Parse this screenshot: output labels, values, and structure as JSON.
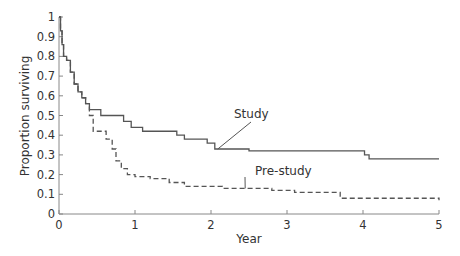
{
  "chart_data": {
    "type": "line",
    "subtype": "step (Kaplan-Meier survival curves)",
    "title": "",
    "xlabel": "Year",
    "ylabel": "Proportion surviving",
    "xlim": [
      0,
      5
    ],
    "ylim": [
      0,
      1
    ],
    "xticks": [
      0,
      1,
      2,
      3,
      4,
      5
    ],
    "yticks": [
      0,
      0.1,
      0.2,
      0.3,
      0.4,
      0.5,
      0.6,
      0.7,
      0.8,
      0.9,
      1
    ],
    "grid": false,
    "legend": "none (direct line annotations)",
    "series": [
      {
        "name": "Study",
        "style": "solid",
        "color": "#555555",
        "x": [
          0,
          0.02,
          0.04,
          0.06,
          0.1,
          0.15,
          0.2,
          0.25,
          0.3,
          0.35,
          0.4,
          0.55,
          0.85,
          0.95,
          1.1,
          1.55,
          1.65,
          1.95,
          2.05,
          2.5,
          4.02,
          4.08,
          5
        ],
        "y": [
          1.0,
          0.93,
          0.86,
          0.8,
          0.78,
          0.72,
          0.66,
          0.62,
          0.59,
          0.56,
          0.53,
          0.5,
          0.47,
          0.44,
          0.42,
          0.4,
          0.38,
          0.36,
          0.33,
          0.32,
          0.3,
          0.28,
          0.28
        ]
      },
      {
        "name": "Pre-study",
        "style": "dashed",
        "color": "#555555",
        "x": [
          0,
          0.02,
          0.04,
          0.06,
          0.1,
          0.15,
          0.2,
          0.25,
          0.3,
          0.35,
          0.4,
          0.45,
          0.62,
          0.7,
          0.75,
          0.82,
          0.9,
          1.0,
          1.2,
          1.45,
          1.65,
          2.15,
          2.8,
          3.1,
          3.7,
          5
        ],
        "y": [
          1.0,
          0.93,
          0.86,
          0.8,
          0.78,
          0.72,
          0.66,
          0.62,
          0.59,
          0.56,
          0.5,
          0.42,
          0.38,
          0.33,
          0.27,
          0.23,
          0.2,
          0.19,
          0.18,
          0.16,
          0.14,
          0.13,
          0.12,
          0.11,
          0.08,
          0.07
        ]
      }
    ],
    "annotations": [
      {
        "text": "Study",
        "x": 2.25,
        "y": 0.52,
        "points_to": {
          "x": 2.05,
          "y": 0.33
        }
      },
      {
        "text": "Pre-study",
        "x": 2.6,
        "y": 0.2,
        "points_to": {
          "x": 2.45,
          "y": 0.13
        }
      }
    ]
  },
  "labels": {
    "xlabel": "Year",
    "ylabel": "Proportion surviving",
    "annot_study": "Study",
    "annot_prestudy": "Pre-study"
  }
}
